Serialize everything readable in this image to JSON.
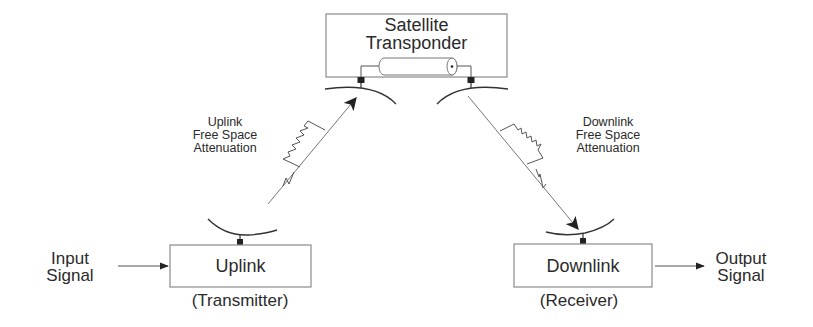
{
  "diagram": {
    "satellite": {
      "line1": "Satellite",
      "line2": "Transponder"
    },
    "uplink_attenuation": {
      "line1": "Uplink",
      "line2": "Free Space",
      "line3": "Attenuation"
    },
    "downlink_attenuation": {
      "line1": "Downlink",
      "line2": "Free Space",
      "line3": "Attenuation"
    },
    "uplink_box": {
      "label": "Uplink",
      "caption": "(Transmitter)"
    },
    "downlink_box": {
      "label": "Downlink",
      "caption": "(Receiver)"
    },
    "input": {
      "line1": "Input",
      "line2": "Signal"
    },
    "output": {
      "line1": "Output",
      "line2": "Signal"
    },
    "colors": {
      "stroke": "#555555",
      "box_border": "#8a8a8a",
      "text": "#2a2a2a",
      "connector": "#222222"
    }
  }
}
